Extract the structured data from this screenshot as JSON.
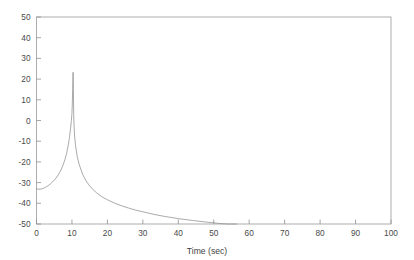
{
  "figure": {
    "background_color": "#ffffff",
    "frame_color": "#9a9a9a",
    "curve_color": "#8d8d8d",
    "tick_label_color": "#4a4a4a"
  },
  "chart_data": {
    "type": "line",
    "title": "",
    "xlabel": "Time (sec)",
    "ylabel": "",
    "xlim": [
      0,
      100
    ],
    "ylim": [
      -50,
      50
    ],
    "xticks": [
      0,
      10,
      20,
      30,
      40,
      50,
      60,
      70,
      80,
      90,
      100
    ],
    "xticklabels": [
      "0",
      "10",
      "20",
      "30",
      "40",
      "50",
      "60",
      "70",
      "80",
      "90",
      "100"
    ],
    "yticks": [
      -50,
      -40,
      -30,
      -20,
      -10,
      0,
      10,
      20,
      30,
      40,
      50
    ],
    "yticklabels": [
      "-50",
      "-40",
      "-30",
      "-20",
      "-10",
      "0",
      "10",
      "20",
      "30",
      "40",
      "50"
    ],
    "grid": false,
    "legend": null,
    "annotations": [],
    "series": [
      {
        "name": "response",
        "x": [
          0.0,
          0.5,
          1.0,
          1.5,
          2.0,
          2.5,
          3.0,
          3.5,
          4.0,
          4.5,
          5.0,
          5.5,
          6.0,
          6.5,
          7.0,
          7.5,
          8.0,
          8.5,
          9.0,
          9.3,
          9.6,
          9.85,
          10.0,
          10.1,
          10.2,
          10.28,
          10.32,
          10.36,
          10.4,
          10.45,
          10.5,
          10.6,
          10.75,
          11.0,
          11.5,
          12.0,
          13.0,
          14.0,
          15.0,
          16.0,
          17.0,
          18.0,
          19.0,
          20.0,
          22.0,
          24.0,
          26.0,
          28.0,
          30.0,
          33.0,
          36.0,
          40.0,
          44.0,
          48.0,
          52.0,
          54.0,
          56.0,
          56.5
        ],
        "y": [
          -33.0,
          -33.2,
          -33.2,
          -33.0,
          -32.7,
          -32.3,
          -31.8,
          -31.2,
          -30.5,
          -29.7,
          -28.8,
          -27.8,
          -26.6,
          -25.2,
          -23.5,
          -21.5,
          -19.0,
          -15.8,
          -11.5,
          -8.2,
          -4.0,
          0.0,
          3.5,
          8.0,
          15.0,
          21.0,
          23.3,
          21.0,
          15.5,
          8.0,
          2.5,
          -3.0,
          -7.5,
          -12.0,
          -17.5,
          -21.0,
          -26.0,
          -29.2,
          -31.6,
          -33.5,
          -35.0,
          -36.3,
          -37.4,
          -38.3,
          -39.9,
          -41.2,
          -42.3,
          -43.3,
          -44.1,
          -45.3,
          -46.3,
          -47.4,
          -48.3,
          -49.1,
          -49.8,
          -50.0,
          -50.0,
          -50.0
        ]
      }
    ]
  }
}
